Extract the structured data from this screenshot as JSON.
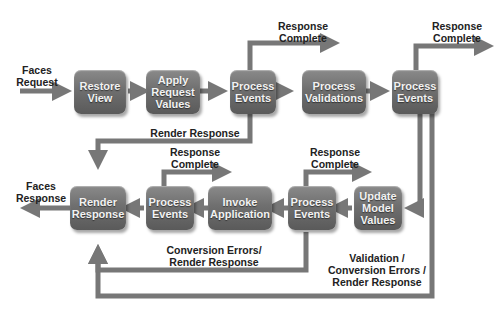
{
  "colors": {
    "box": "#6f6f6f",
    "arrow": "#777777",
    "text_on_box": "#f2f2f2",
    "label": "#222222"
  },
  "boxes": {
    "restore_view": "Restore\nView",
    "apply_request_values": "Apply\nRequest\nValues",
    "process_events_1": "Process\nEvents",
    "process_validations": "Process\nValidations",
    "process_events_2": "Process\nEvents",
    "update_model_values": "Update\nModel\nValues",
    "process_events_3": "Process\nEvents",
    "invoke_application": "Invoke\nApplication",
    "process_events_4": "Process\nEvents",
    "render_response": "Render\nResponse"
  },
  "labels": {
    "faces_request": "Faces\nRequest",
    "faces_response": "Faces\nResponse",
    "response_complete_1": "Response\nComplete",
    "response_complete_2": "Response\nComplete",
    "response_complete_3": "Response\nComplete",
    "response_complete_4": "Response\nComplete",
    "render_response_path": "Render Response",
    "conversion_errors": "Conversion Errors/\nRender Response",
    "validation_errors": "Validation /\nConversion Errors /\nRender Response"
  }
}
